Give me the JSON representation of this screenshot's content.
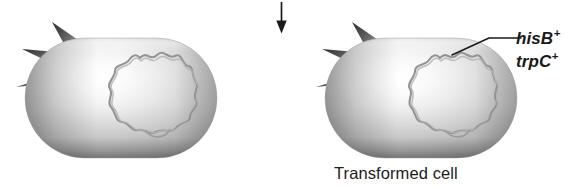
{
  "figure": {
    "type": "bacterial-transformation-diagram",
    "background_color": "#ffffff",
    "ink_color": "#1a1a1a"
  },
  "arrow": {
    "name": "downward-process-arrow",
    "direction": "down",
    "x": 281,
    "y_start": 2,
    "y_end": 33,
    "color": "#1a1a1a"
  },
  "cells": [
    {
      "id": "recipient-cell",
      "label": "",
      "x": 25,
      "y": 38,
      "width": 192,
      "height": 120,
      "spike_count": 3,
      "has_chromosome": true,
      "body_color_light": "#fbfbfb",
      "body_color_mid": "#c9c9c9",
      "body_color_dark": "#6e6e6e",
      "spike_color": "#4a4a4a",
      "chromosome_color": "#8c8c8c"
    },
    {
      "id": "transformed-cell",
      "label": "Transformed cell",
      "x": 325,
      "y": 38,
      "width": 192,
      "height": 120,
      "spike_count": 3,
      "has_chromosome": true,
      "body_color_light": "#fbfbfb",
      "body_color_mid": "#c9c9c9",
      "body_color_dark": "#6e6e6e",
      "spike_color": "#4a4a4a",
      "chromosome_color": "#8c8c8c"
    }
  ],
  "annotations": {
    "gene_markers": [
      {
        "id": "hisB",
        "gene": "hisB",
        "superscript": "+"
      },
      {
        "id": "trpC",
        "gene": "trpC",
        "superscript": "+"
      }
    ],
    "leader_line": {
      "name": "gene-leader-line",
      "from_x": 452,
      "from_y": 55,
      "bend_x": 489,
      "bend_y": 38,
      "to_x": 521,
      "to_y": 38,
      "color": "#1a1a1a"
    }
  },
  "caption": {
    "transformed_cell": "Transformed cell"
  }
}
